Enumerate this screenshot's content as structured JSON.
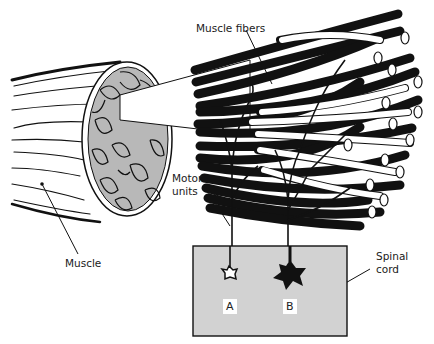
{
  "diagram": {
    "type": "anatomy-illustration",
    "labels": {
      "muscle_fibers": "Muscle fibers",
      "motor_units_line1": "Motor",
      "motor_units_line2": "units",
      "muscle": "Muscle",
      "spinal_cord_line1": "Spinal",
      "spinal_cord_line2": "cord",
      "neuron_a": "A",
      "neuron_b": "B"
    },
    "colors": {
      "ink": "#111111",
      "cross_section_fill": "#b8b8b8",
      "spinal_cord_fill": "#d2d2d2",
      "background": "#ffffff"
    }
  }
}
